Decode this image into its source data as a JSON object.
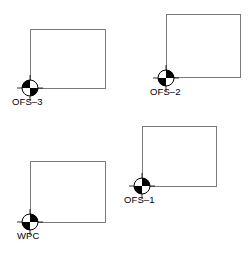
{
  "figure": {
    "width": 251,
    "height": 258,
    "background_color": "#ffffff",
    "outline_color": "#7a7a7a",
    "marker_fill_color": "#000000",
    "marker_empty_color": "#ffffff",
    "label_color": "#000000"
  },
  "sites": [
    {
      "id": "ofs-3",
      "label": "OFS–3",
      "rect": {
        "left": 30,
        "top": 29,
        "width": 76,
        "height": 60
      },
      "marker": {
        "x": 30,
        "y": 88
      },
      "label_pos": {
        "left": 12,
        "top": 96
      }
    },
    {
      "id": "ofs-2",
      "label": "OFS–2",
      "rect": {
        "left": 166,
        "top": 14,
        "width": 75,
        "height": 64
      },
      "marker": {
        "x": 166,
        "y": 78
      },
      "label_pos": {
        "left": 150,
        "top": 86
      }
    },
    {
      "id": "ofs-1",
      "label": "OFS–1",
      "rect": {
        "left": 142,
        "top": 126,
        "width": 75,
        "height": 61
      },
      "marker": {
        "x": 142,
        "y": 186
      },
      "label_pos": {
        "left": 124,
        "top": 194
      }
    },
    {
      "id": "wpc",
      "label": "WPC",
      "rect": {
        "left": 30,
        "top": 161,
        "width": 76,
        "height": 62
      },
      "marker": {
        "x": 30,
        "y": 222
      },
      "label_pos": {
        "left": 17,
        "top": 230
      }
    }
  ]
}
